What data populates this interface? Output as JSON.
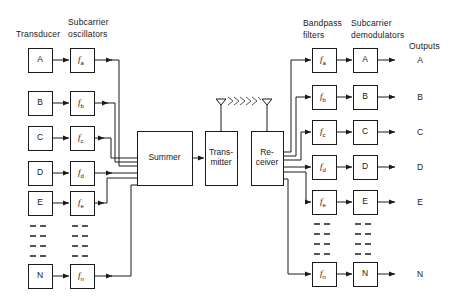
{
  "diagram": {
    "line_color": "#1a1a1a",
    "box_fill": "#ffffff",
    "background": "#ffffff"
  },
  "headers": {
    "transducer": "Transducer",
    "subcarrier_oscillators_line1": "Subcarrier",
    "subcarrier_oscillators_line2": "oscillators",
    "bandpass_filters_line1": "Bandpass",
    "bandpass_filters_line2": "filters",
    "subcarrier_demodulators_line1": "Subcarrier",
    "subcarrier_demodulators_line2": "demodulators",
    "outputs": "Outputs"
  },
  "center": {
    "summer": "Summer",
    "transmitter_line1": "Trans-",
    "transmitter_line2": "mitter",
    "receiver_line1": "Re-",
    "receiver_line2": "ceiver",
    "wave_chevrons": 6
  },
  "transmit_channels": [
    {
      "transducer": "A",
      "oscillator": "f",
      "oscillator_sub": "a"
    },
    {
      "transducer": "B",
      "oscillator": "f",
      "oscillator_sub": "b"
    },
    {
      "transducer": "C",
      "oscillator": "f",
      "oscillator_sub": "c"
    },
    {
      "transducer": "D",
      "oscillator": "f",
      "oscillator_sub": "d"
    },
    {
      "transducer": "E",
      "oscillator": "f",
      "oscillator_sub": "e"
    },
    {
      "transducer": "N",
      "oscillator": "f",
      "oscillator_sub": "n"
    }
  ],
  "receive_channels": [
    {
      "filter": "f",
      "filter_sub": "a",
      "demodulator": "A",
      "output": "A"
    },
    {
      "filter": "f",
      "filter_sub": "b",
      "demodulator": "B",
      "output": "B"
    },
    {
      "filter": "f",
      "filter_sub": "c",
      "demodulator": "C",
      "output": "C"
    },
    {
      "filter": "f",
      "filter_sub": "d",
      "demodulator": "D",
      "output": "D"
    },
    {
      "filter": "f",
      "filter_sub": "e",
      "demodulator": "E",
      "output": "E"
    },
    {
      "filter": "f",
      "filter_sub": "n",
      "demodulator": "N",
      "output": "N"
    }
  ],
  "ellipsis": {
    "rows": 4,
    "dashes_per_group": 3,
    "note": "dashed continuation marks between channel E and channel N"
  }
}
